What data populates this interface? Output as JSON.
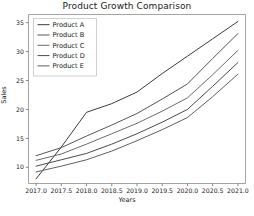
{
  "chart_data": {
    "type": "line",
    "title": "Product Growth Comparison",
    "xlabel": "Years",
    "ylabel": "Sales",
    "xlim": [
      2016.85,
      2021.15
    ],
    "ylim": [
      7.2,
      36.4
    ],
    "xticks": [
      "2017.0",
      "2017.5",
      "2018.0",
      "2018.5",
      "2019.0",
      "2019.5",
      "2020.0",
      "2020.5",
      "2021.0"
    ],
    "xtick_values": [
      2017.0,
      2017.5,
      2018.0,
      2018.5,
      2019.0,
      2019.5,
      2020.0,
      2020.5,
      2021.0
    ],
    "yticks": [
      "10",
      "15",
      "20",
      "25",
      "30",
      "35"
    ],
    "ytick_values": [
      10,
      15,
      20,
      25,
      30,
      35
    ],
    "grid": false,
    "legend_position": "upper left",
    "x": [
      2017.0,
      2017.5,
      2018.0,
      2018.5,
      2019.0,
      2019.5,
      2020.0,
      2020.5,
      2021.0
    ],
    "series": [
      {
        "name": "Product A",
        "color": "#3b3b3b",
        "values": [
          8.0,
          13.5,
          19.5,
          21.0,
          23.0,
          26.2,
          29.2,
          32.2,
          35.2
        ]
      },
      {
        "name": "Product B",
        "color": "#555555",
        "values": [
          12.0,
          13.4,
          15.4,
          17.3,
          19.3,
          21.8,
          24.4,
          28.8,
          33.1
        ]
      },
      {
        "name": "Product C",
        "color": "#6b6b6b",
        "values": [
          11.2,
          12.3,
          14.0,
          15.8,
          17.6,
          19.7,
          22.0,
          26.0,
          30.2
        ]
      },
      {
        "name": "Product D",
        "color": "#4a4a4a",
        "values": [
          10.2,
          11.3,
          12.4,
          14.0,
          15.8,
          17.8,
          20.0,
          24.0,
          28.1
        ]
      },
      {
        "name": "Product E",
        "color": "#5f5f5f",
        "values": [
          9.2,
          10.2,
          11.3,
          12.8,
          14.6,
          16.5,
          18.6,
          22.2,
          26.1
        ]
      }
    ]
  }
}
